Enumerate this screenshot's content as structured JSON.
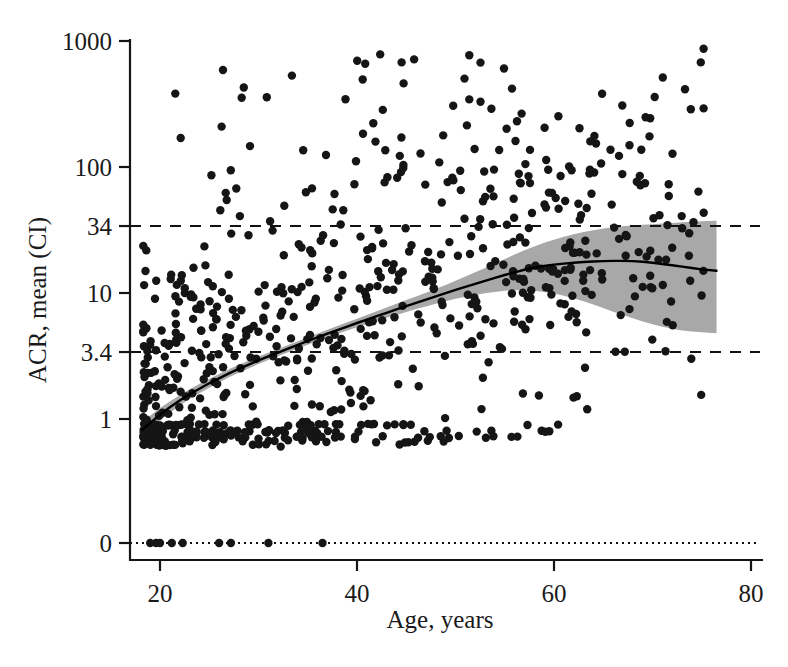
{
  "chart_data": {
    "type": "scatter",
    "title": "",
    "xlabel": "Age, years",
    "ylabel": "ACR, mean (CI)",
    "grid": false,
    "legend": null,
    "yscale": "log",
    "xlim": [
      18,
      81
    ],
    "ylim_log": [
      0.55,
      1400
    ],
    "xticks": [
      20,
      40,
      60,
      80
    ],
    "xtick_labels": [
      "20",
      "40",
      "60",
      "80"
    ],
    "yticks": [
      1000,
      100,
      34,
      10,
      3.4,
      1,
      0
    ],
    "ytick_labels": [
      "1000",
      "100",
      "34",
      "10",
      "3.4",
      "1",
      "0"
    ],
    "reference_lines": [
      {
        "name": "upper-threshold",
        "value": 34,
        "style": "dashed"
      },
      {
        "name": "lower-threshold",
        "value": 3.4,
        "style": "dashed"
      },
      {
        "name": "zero-baseline",
        "value": 0,
        "style": "dotted"
      }
    ],
    "fit_curve": {
      "name": "mean ACR fitted curve",
      "x": [
        18.2,
        19,
        20,
        21,
        22,
        23,
        24,
        25,
        26,
        27,
        28,
        29,
        30,
        31,
        32,
        33,
        34,
        35,
        36,
        37,
        38,
        39,
        40,
        41,
        42,
        43,
        44,
        45,
        46,
        47,
        48,
        49,
        50,
        51,
        52,
        53,
        54,
        55,
        56,
        57,
        58,
        59,
        60,
        61,
        62,
        63,
        64,
        65,
        66,
        67,
        68,
        69,
        70,
        71,
        72,
        73,
        74,
        75,
        76.5
      ],
      "y": [
        0.82,
        0.93,
        1.08,
        1.24,
        1.4,
        1.57,
        1.74,
        1.92,
        2.1,
        2.3,
        2.5,
        2.7,
        2.92,
        3.14,
        3.37,
        3.62,
        3.88,
        4.16,
        4.45,
        4.76,
        5.08,
        5.42,
        5.78,
        6.15,
        6.55,
        6.96,
        7.4,
        7.86,
        8.35,
        8.86,
        9.4,
        9.96,
        10.6,
        11.2,
        11.8,
        12.5,
        13.2,
        13.9,
        14.6,
        15.3,
        15.9,
        16.4,
        16.8,
        17.1,
        17.4,
        17.6,
        17.8,
        17.9,
        18.0,
        18.0,
        17.9,
        17.7,
        17.4,
        17.0,
        16.6,
        16.2,
        15.8,
        15.4,
        15.0
      ]
    },
    "ci_band": {
      "name": "confidence interval band",
      "x": [
        18.2,
        19,
        20,
        21,
        22,
        23,
        24,
        25,
        26,
        27,
        28,
        29,
        30,
        31,
        32,
        33,
        34,
        35,
        36,
        37,
        38,
        39,
        40,
        41,
        42,
        43,
        44,
        45,
        46,
        47,
        48,
        49,
        50,
        51,
        52,
        53,
        54,
        55,
        56,
        57,
        58,
        59,
        60,
        61,
        62,
        63,
        64,
        65,
        66,
        67,
        68,
        69,
        70,
        71,
        72,
        73,
        74,
        75,
        76.5
      ],
      "lower": [
        0.72,
        0.82,
        0.97,
        1.12,
        1.28,
        1.44,
        1.6,
        1.77,
        1.95,
        2.14,
        2.33,
        2.52,
        2.73,
        2.94,
        3.16,
        3.39,
        3.63,
        3.89,
        4.16,
        4.44,
        4.73,
        5.03,
        5.35,
        5.67,
        6.0,
        6.35,
        6.7,
        7.07,
        7.45,
        7.83,
        8.22,
        8.6,
        9.0,
        9.35,
        9.65,
        9.95,
        10.2,
        10.4,
        10.5,
        10.5,
        10.4,
        10.2,
        9.9,
        9.5,
        9.1,
        8.6,
        8.1,
        7.6,
        7.1,
        6.7,
        6.3,
        5.95,
        5.65,
        5.4,
        5.2,
        5.05,
        4.95,
        4.88,
        4.8
      ],
      "upper": [
        0.94,
        1.06,
        1.22,
        1.38,
        1.54,
        1.72,
        1.9,
        2.09,
        2.28,
        2.48,
        2.69,
        2.9,
        3.13,
        3.36,
        3.6,
        3.87,
        4.15,
        4.45,
        4.77,
        5.11,
        5.47,
        5.86,
        6.26,
        6.7,
        7.17,
        7.66,
        8.2,
        8.78,
        9.4,
        10.05,
        10.8,
        11.6,
        12.5,
        13.5,
        14.6,
        15.8,
        17.1,
        18.6,
        20.2,
        21.8,
        23.4,
        25.0,
        26.5,
        28.0,
        29.3,
        30.5,
        31.5,
        32.5,
        33.2,
        33.8,
        34.3,
        34.8,
        35.2,
        35.6,
        36.0,
        36.4,
        36.8,
        37.1,
        37.5
      ]
    },
    "scatter_points": {
      "name": "ACR observations",
      "marker": "filled-circle",
      "color": "#151515",
      "n_visible_approx": 700,
      "x": [
        18.3,
        18.4,
        18.5,
        18.6,
        18.6,
        18.7,
        18.8,
        18.9,
        19.0,
        19.0,
        19.1,
        19.2,
        19.3,
        19.4,
        19.5,
        19.5,
        19.6,
        19.7,
        19.8,
        19.9,
        20.0,
        20.1,
        20.2,
        20.3,
        20.4,
        20.5,
        20.6,
        20.7,
        20.8,
        20.9,
        21.0,
        21.1,
        21.2,
        21.3,
        21.4,
        21.5,
        21.6,
        21.7,
        21.8,
        21.9,
        22.0,
        22.2,
        22.4,
        22.6,
        22.8,
        23.0,
        23.2,
        23.4,
        23.6,
        23.8,
        24.0,
        24.2,
        24.4,
        24.6,
        24.8,
        25.0,
        25.2,
        25.4,
        25.6,
        25.8,
        26.0,
        26.3,
        26.6,
        26.9,
        27.2,
        27.5,
        27.8,
        28.1,
        28.4,
        28.7,
        29.0,
        29.3,
        29.6,
        29.9,
        30.2,
        30.5,
        30.8,
        31.1,
        31.4,
        31.7,
        32.0,
        32.4,
        32.8,
        33.2,
        33.6,
        34.0,
        34.4,
        34.8,
        35.2,
        35.6,
        36.0,
        36.5,
        37.0,
        37.5,
        38.0,
        38.5,
        39.0,
        39.5,
        40.0,
        40.5,
        41.0,
        41.5,
        42.0,
        42.5,
        43.0,
        43.5,
        44.0,
        44.5,
        45.0,
        45.5,
        46.0,
        46.5,
        47.0,
        47.5,
        48.0,
        48.5,
        49.0,
        49.5,
        50.0,
        50.5,
        51.0,
        51.5,
        52.0,
        52.5,
        53.0,
        53.5,
        54.0,
        54.5,
        55.0,
        55.5,
        56.0,
        56.5,
        57.0,
        57.5,
        58.0,
        58.5,
        59.0,
        59.5,
        60.0,
        60.5,
        61.0,
        61.5,
        62.0,
        62.5,
        63.0,
        63.5,
        64.0,
        64.5,
        65.0,
        65.5,
        66.0,
        66.5,
        67.0,
        67.5,
        68.0,
        68.5,
        69.0,
        70.0,
        71.0,
        72.0,
        73.0,
        74.0,
        75.0,
        76.0
      ],
      "note": "Dense log-scaled cloud spanning 0.6 to 1000; discrete horizontal bands visible near 0.6, 0.75, 0.9 and a row of points on the 0 baseline."
    },
    "annotations": []
  },
  "figure": {
    "background_color": "#ffffff",
    "point_color": "#151515",
    "band_color": "#a8a8a8",
    "line_color": "#000000"
  }
}
